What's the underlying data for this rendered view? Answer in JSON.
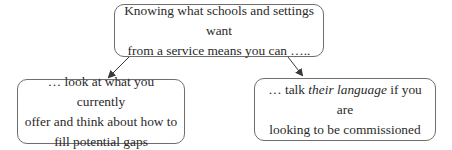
{
  "diagram": {
    "top_box": {
      "line1": "Knowing what schools and settings want",
      "line2": "from a service means you can ….."
    },
    "left_box": {
      "line1": "… look at what you currently",
      "line2": "offer and think about how to",
      "line3": "fill potential gaps"
    },
    "right_box": {
      "line1_pre": "… talk ",
      "line1_em": "their language",
      "line1_post": " if you are",
      "line2": "looking to be commissioned"
    },
    "arrows": [
      {
        "from": "top_box",
        "to": "left_box"
      },
      {
        "from": "top_box",
        "to": "right_box"
      }
    ],
    "colors": {
      "border": "#6e6e6e",
      "text": "#2a2a2a",
      "arrow": "#3a3a3a"
    }
  }
}
